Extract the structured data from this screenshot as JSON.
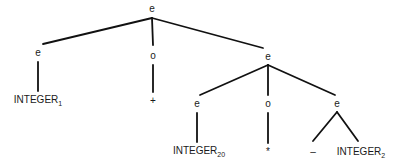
{
  "diagram": {
    "type": "parse-tree",
    "nodes": [
      {
        "id": "root",
        "label": "e",
        "x": 152,
        "y": 9
      },
      {
        "id": "e1",
        "label": "e",
        "x": 38,
        "y": 53
      },
      {
        "id": "o1",
        "label": "o",
        "x": 153,
        "y": 56
      },
      {
        "id": "e2",
        "label": "e",
        "x": 268,
        "y": 57
      },
      {
        "id": "int1",
        "label": "INTEGER",
        "sub": "1",
        "x": 38,
        "y": 100
      },
      {
        "id": "plus",
        "label": "+",
        "x": 153,
        "y": 101
      },
      {
        "id": "e3",
        "label": "e",
        "x": 197,
        "y": 104
      },
      {
        "id": "o2",
        "label": "o",
        "x": 268,
        "y": 104
      },
      {
        "id": "e4",
        "label": "e",
        "x": 337,
        "y": 104
      },
      {
        "id": "int20",
        "label": "INTEGER",
        "sub": "20",
        "x": 199,
        "y": 151
      },
      {
        "id": "star",
        "label": "*",
        "x": 268,
        "y": 152
      },
      {
        "id": "minus",
        "label": "–",
        "x": 313,
        "y": 152
      },
      {
        "id": "int2",
        "label": "INTEGER",
        "sub": "2",
        "x": 361,
        "y": 152
      }
    ],
    "edges": [
      [
        "root",
        "e1"
      ],
      [
        "root",
        "o1"
      ],
      [
        "root",
        "e2"
      ],
      [
        "e1",
        "int1"
      ],
      [
        "o1",
        "plus"
      ],
      [
        "e2",
        "e3"
      ],
      [
        "e2",
        "o2"
      ],
      [
        "e2",
        "e4"
      ],
      [
        "e3",
        "int20"
      ],
      [
        "o2",
        "star"
      ],
      [
        "e4",
        "minus"
      ],
      [
        "e4",
        "int2"
      ]
    ]
  }
}
